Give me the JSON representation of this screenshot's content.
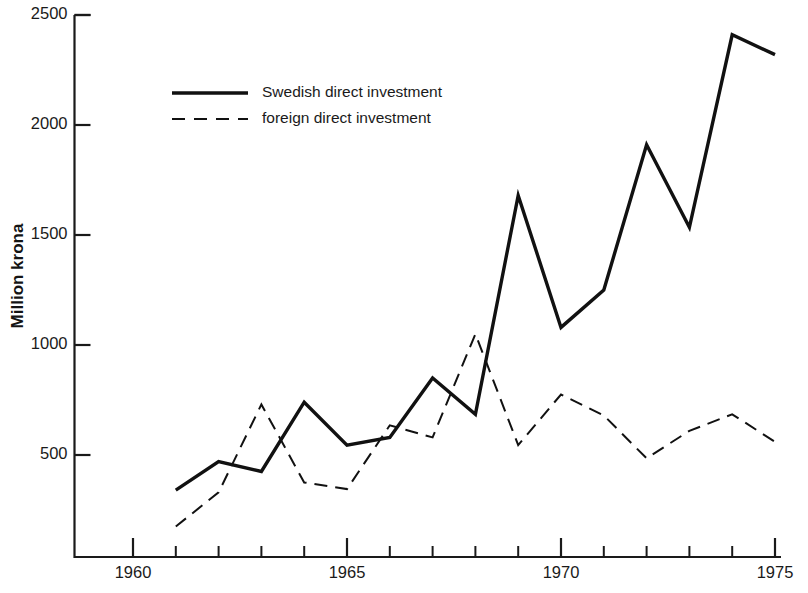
{
  "chart_data": {
    "type": "line",
    "title": "",
    "xlabel": "",
    "ylabel": "Million krona",
    "xlim": [
      1960,
      1975
    ],
    "ylim": [
      0,
      2500
    ],
    "grid": false,
    "legend_position": "upper-left-inset",
    "x": [
      1961,
      1962,
      1963,
      1964,
      1965,
      1966,
      1967,
      1968,
      1969,
      1970,
      1971,
      1972,
      1973,
      1974,
      1975
    ],
    "xticks_major": [
      "1960",
      "1965",
      "1970",
      "1975"
    ],
    "xticks_major_values": [
      1960,
      1965,
      1970,
      1975
    ],
    "xticks_minor_values": [
      1961,
      1962,
      1963,
      1964,
      1966,
      1967,
      1968,
      1969,
      1971,
      1972,
      1973,
      1974
    ],
    "yticks": [
      "500",
      "1000",
      "1500",
      "2000",
      "2500"
    ],
    "ytick_values": [
      500,
      1000,
      1500,
      2000,
      2500
    ],
    "series": [
      {
        "name": "Swedish direct investment",
        "style": "solid",
        "color": "#111111",
        "width": 3.4,
        "values": [
          340,
          470,
          425,
          740,
          545,
          580,
          850,
          685,
          1680,
          1080,
          1250,
          1910,
          1535,
          2410,
          2320
        ]
      },
      {
        "name": "foreign direct investment",
        "style": "dashed",
        "color": "#111111",
        "width": 2.0,
        "values": [
          175,
          330,
          730,
          375,
          345,
          635,
          580,
          1050,
          545,
          775,
          680,
          485,
          610,
          685,
          560
        ]
      }
    ]
  },
  "legend": {
    "items": [
      {
        "label": "Swedish direct investment",
        "style": "solid"
      },
      {
        "label": "foreign direct investment",
        "style": "dashed"
      }
    ]
  },
  "axis": {
    "y_title": "Million krona"
  }
}
